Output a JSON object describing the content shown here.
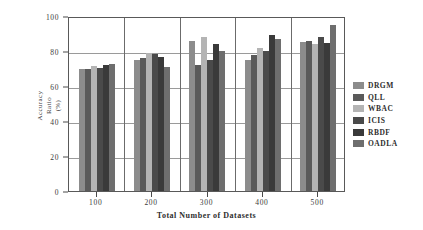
{
  "chart_data": {
    "type": "bar",
    "title": "",
    "xlabel": "Total Number of Datasets",
    "ylabel": "Accuracy\nRatio\n(%)",
    "ylabel_lines": [
      "Accuracy",
      "Ratio",
      "(%)"
    ],
    "categories": [
      "100",
      "200",
      "300",
      "400",
      "500"
    ],
    "ylim": [
      0,
      100
    ],
    "yticks": [
      0,
      20,
      40,
      60,
      80,
      100
    ],
    "ytick_labels": [
      "0",
      "20",
      "40",
      "60",
      "80",
      "100"
    ],
    "grid": true,
    "grid_axis": "y",
    "legend_position": "right",
    "series": [
      {
        "name": "DRGM",
        "color": "#8c8c8c",
        "values": [
          69.5,
          75.0,
          86.0,
          74.8,
          85.0
        ]
      },
      {
        "name": "QLL",
        "color": "#5a5a5a",
        "values": [
          70.0,
          75.8,
          71.8,
          77.5,
          86.0
        ]
      },
      {
        "name": "WBAC",
        "color": "#b4b4b4",
        "values": [
          71.2,
          79.0,
          88.0,
          81.8,
          84.0
        ]
      },
      {
        "name": "ICIS",
        "color": "#4a4a4a",
        "values": [
          70.5,
          78.5,
          74.8,
          80.0,
          88.0
        ]
      },
      {
        "name": "RBDF",
        "color": "#3a3a3a",
        "values": [
          71.8,
          76.8,
          84.0,
          89.0,
          84.5
        ]
      },
      {
        "name": "OADLA",
        "color": "#6e6e6e",
        "values": [
          72.6,
          70.8,
          79.8,
          87.0,
          94.8
        ]
      }
    ]
  }
}
